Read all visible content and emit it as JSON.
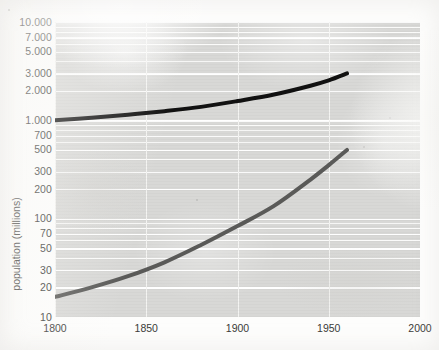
{
  "figure": {
    "background_color": "#fdfdfc",
    "plot_background_color": "#d8d8d6",
    "gridline_color": "#ffffff"
  },
  "axes": {
    "y_title": "population (millions)",
    "y_scale": "log",
    "x_scale": "linear"
  },
  "chart_data": {
    "type": "line",
    "title": "",
    "subtitle": "",
    "xlabel": "",
    "ylabel": "population (millions)",
    "scale": {
      "x": "linear",
      "y": "log"
    },
    "xlim": [
      1800,
      2000
    ],
    "ylim": [
      10,
      10000
    ],
    "grid": true,
    "legend_position": "none",
    "xticks": [
      1800,
      1850,
      1900,
      1950,
      2000
    ],
    "xticklabels": [
      "1800",
      "1850",
      "1900",
      "1950",
      "2000"
    ],
    "yticks": [
      10000,
      7000,
      5000,
      3000,
      2000,
      1000,
      700,
      500,
      300,
      200,
      100,
      70,
      50,
      30,
      20,
      10
    ],
    "yticklabels": [
      "10.000",
      "7.000",
      "5.000",
      "3.000",
      "2.000",
      "1.000",
      "700",
      "500",
      "300",
      "200",
      "100",
      "70",
      "50",
      "30",
      "20",
      "10"
    ],
    "y_units": "millions",
    "series": [
      {
        "name": "upper-curve",
        "color": "#111111",
        "line_width": 4,
        "x": [
          1800,
          1820,
          1840,
          1860,
          1880,
          1900,
          1920,
          1940,
          1950,
          1960
        ],
        "values": [
          1000,
          1060,
          1140,
          1240,
          1370,
          1570,
          1830,
          2250,
          2550,
          3000
        ]
      },
      {
        "name": "lower-curve",
        "color": "#5a5a58",
        "line_width": 4,
        "x": [
          1800,
          1820,
          1840,
          1860,
          1880,
          1900,
          1920,
          1940,
          1950,
          1960
        ],
        "values": [
          16,
          20,
          26,
          36,
          54,
          84,
          135,
          250,
          350,
          500
        ]
      }
    ]
  }
}
